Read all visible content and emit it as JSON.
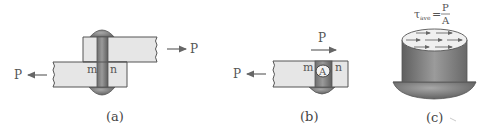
{
  "figure": {
    "panels": [
      {
        "id": "a",
        "caption": "(a)",
        "labels": {
          "left_force": "P",
          "right_force": "P",
          "plane_left": "m",
          "plane_right": "n"
        },
        "description": "Two overlapping plates joined by a rivet, loaded by equal opposite forces P"
      },
      {
        "id": "b",
        "caption": "(b)",
        "labels": {
          "left_force": "P",
          "top_force": "P",
          "plane_left": "m",
          "plane_right": "n",
          "area": "A"
        },
        "description": "Free body of lower plate with lower rivet half; shear area A on plane mn"
      },
      {
        "id": "c",
        "caption": "(c)",
        "labels": {
          "tau": "τ",
          "tau_sub": "ave",
          "equals": "=",
          "numerator": "P",
          "denominator": "A"
        },
        "description": "Rivet shank with uniformly distributed shear stress arrows on cut face"
      }
    ]
  },
  "colors": {
    "plate_fill": "#e6e6e6",
    "plate_stroke": "#555555",
    "rivet_dark": "#6a6a6a",
    "rivet_mid": "#8c8c8c",
    "arrow": "#666666",
    "label": "#555555"
  }
}
